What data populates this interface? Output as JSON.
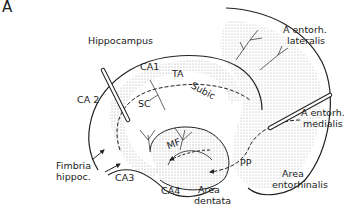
{
  "panel_label": "A",
  "labels": {
    "hippocampus": "Hippocampus",
    "ca1": "CA1",
    "ca2": "CA 2",
    "ca3": "CA3",
    "ca4": "CA4",
    "ta": "TA",
    "sc": "SC",
    "subic": "Subic",
    "mf": "MF",
    "pp": "PP",
    "fimbria_1": "Fimbria",
    "fimbria_2": "hippoc.",
    "area_dentata_1": "Area",
    "area_dentata_2": "dentata",
    "a_entorh_lateralis_1": "A entorh.",
    "a_entorh_lateralis_2": "lateralis",
    "a_entorh_medialis_1": "A entorh.",
    "a_entorh_medialis_2": "medialis",
    "area_entorhinalis_1": "Area",
    "area_entorhinalis_2": "entorhinalis"
  },
  "colors": {
    "ink": "#222222",
    "stipple": "#cfcfcf",
    "background": "#ffffff"
  }
}
